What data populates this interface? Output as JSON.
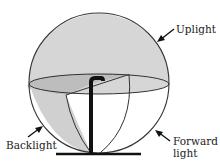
{
  "diagram": {
    "type": "luminaire light distribution sphere",
    "labels": {
      "uplight": "Uplight",
      "backlight": "Backlight",
      "forward_line1": "Forward",
      "forward_line2": "light"
    },
    "colors": {
      "upper_hemisphere": "#d6d6d6",
      "back_wedge": "#bdbdbd",
      "backlight_region": "#d0d0d0",
      "outline": "#333333",
      "pole": "#111111",
      "background": "#ffffff"
    },
    "regions": [
      "Uplight (upper hemisphere)",
      "Backlight (lower back quarter)",
      "Forward light (lower front quarter)"
    ]
  }
}
